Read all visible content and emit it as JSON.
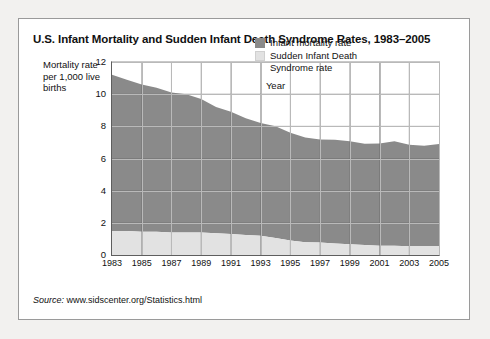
{
  "card": {
    "title": "U.S. Infant Mortality and Sudden Infant Death Syndrome Rates, 1983–2005",
    "y_axis_caption": "Mortality rate per 1,000 live births",
    "source_prefix": "Source:",
    "source_text": "www.sidscenter.org/Statistics.html"
  },
  "colors": {
    "infant_mortality": "#8a8a8a",
    "sids": "#e2e2e2",
    "grid": "#b9b9b9",
    "axis": "#5e5e5e",
    "card_background": "#ffffff",
    "page_background": "#f2f1ef"
  },
  "legend": {
    "position": "top-right",
    "items": [
      {
        "label": "Infant mortality rate",
        "color": "#8a8a8a"
      },
      {
        "label": "Sudden Infant Death Syndrome rate",
        "color": "#e2e2e2"
      }
    ]
  },
  "chart_data": {
    "type": "area",
    "stacked": true,
    "title": "U.S. Infant Mortality and Sudden Infant Death Syndrome Rates, 1983–2005",
    "xlabel": "Year",
    "ylabel": "Mortality rate per 1,000 live births",
    "ylim": [
      0,
      12
    ],
    "yticks": [
      0,
      2,
      4,
      6,
      8,
      10,
      12
    ],
    "xlim": [
      1983,
      2005
    ],
    "xticks": [
      1983,
      1985,
      1987,
      1989,
      1991,
      1993,
      1995,
      1997,
      1999,
      2001,
      2003,
      2005
    ],
    "x": [
      1983,
      1984,
      1985,
      1986,
      1987,
      1988,
      1989,
      1990,
      1991,
      1992,
      1993,
      1994,
      1995,
      1996,
      1997,
      1998,
      1999,
      2000,
      2001,
      2002,
      2003,
      2004,
      2005
    ],
    "grid": true,
    "legend_position": "upper right",
    "series": [
      {
        "name": "Sudden Infant Death Syndrome rate",
        "color": "#e2e2e2",
        "stack_order": "bottom",
        "values": [
          1.5,
          1.5,
          1.45,
          1.45,
          1.4,
          1.4,
          1.4,
          1.35,
          1.3,
          1.25,
          1.2,
          1.05,
          0.9,
          0.8,
          0.78,
          0.72,
          0.67,
          0.62,
          0.58,
          0.57,
          0.55,
          0.54,
          0.54
        ]
      },
      {
        "name": "Infant mortality rate",
        "color": "#8a8a8a",
        "stack_order": "top",
        "values": [
          9.7,
          9.4,
          9.15,
          8.95,
          8.7,
          8.6,
          8.3,
          7.85,
          7.6,
          7.25,
          7.0,
          6.95,
          6.7,
          6.5,
          6.4,
          6.45,
          6.4,
          6.3,
          6.35,
          6.5,
          6.3,
          6.25,
          6.36
        ]
      }
    ],
    "totals": [
      11.2,
      10.9,
      10.6,
      10.4,
      10.1,
      10.0,
      9.7,
      9.2,
      8.9,
      8.5,
      8.2,
      8.0,
      7.6,
      7.3,
      7.18,
      7.17,
      7.07,
      6.92,
      6.93,
      7.07,
      6.85,
      6.79,
      6.9
    ]
  }
}
